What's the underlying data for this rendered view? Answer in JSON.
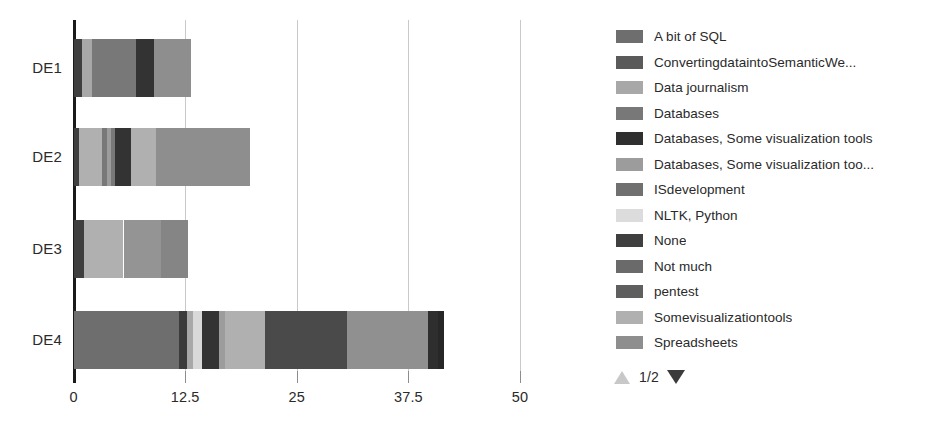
{
  "chart_data": {
    "type": "bar",
    "orientation": "horizontal",
    "stacked": true,
    "title": "",
    "xlabel": "",
    "ylabel": "",
    "xlim": [
      0,
      50
    ],
    "xticks": [
      0,
      12.5,
      25,
      37.5,
      50
    ],
    "xtick_labels": [
      "0",
      "12.5",
      "25",
      "37.5",
      "50"
    ],
    "categories": [
      "DE1",
      "DE2",
      "DE3",
      "DE4"
    ],
    "grid": true,
    "legend_position": "right",
    "series": [
      {
        "name": "A bit of SQL",
        "color": "#6e6e6e",
        "values": [
          0,
          0,
          0,
          11.8
        ]
      },
      {
        "name": "ConvertingdataintoSemanticWe...",
        "color": "#5a5a5a",
        "values": [
          0,
          0,
          0,
          0.8
        ]
      },
      {
        "name": "Data journalism",
        "color": "#a8a8a8",
        "values": [
          1.1,
          0,
          0,
          0.7
        ]
      },
      {
        "name": "Databases",
        "color": "#787878",
        "values": [
          4.9,
          0,
          0,
          0
        ]
      },
      {
        "name": "Databases, Some visualization tools",
        "color": "#333333",
        "values": [
          2.0,
          1.7,
          0,
          1.9
        ]
      },
      {
        "name": "Databases, Some visualization too...",
        "color": "#9c9c9c",
        "values": [
          0,
          1.6,
          0,
          0.7
        ]
      },
      {
        "name": "ISdevelopment",
        "color": "#707070",
        "values": [
          0,
          0,
          0,
          0
        ]
      },
      {
        "name": "NLTK, Python",
        "color": "#d9d9d9",
        "values": [
          0,
          0,
          0,
          1.0
        ]
      },
      {
        "name": "None",
        "color": "#3f3f3f",
        "values": [
          1.0,
          0,
          1.2,
          9.1
        ]
      },
      {
        "name": "Not much",
        "color": "#6a6a6a",
        "values": [
          0,
          0,
          0,
          0
        ]
      },
      {
        "name": "pentest",
        "color": "#5f5f5f",
        "values": [
          0,
          0,
          0,
          1.1
        ]
      },
      {
        "name": "Somevisualizationtools",
        "color": "#b0b0b0",
        "values": [
          0,
          5.9,
          4.4,
          4.5
        ]
      },
      {
        "name": "Spreadsheets",
        "color": "#8e8e8e",
        "values": [
          4.2,
          10.6,
          7.0,
          9.1
        ]
      }
    ],
    "bars": [
      {
        "category": "DE1",
        "total": 13.2,
        "segments": [
          {
            "label": "None",
            "value": 1.0,
            "color": "#3f3f3f"
          },
          {
            "label": "Data journalism",
            "value": 1.1,
            "color": "#a8a8a8"
          },
          {
            "label": "Databases",
            "value": 4.9,
            "color": "#787878"
          },
          {
            "label": "Databases, Some visualization tools",
            "value": 2.0,
            "color": "#333333"
          },
          {
            "label": "Spreadsheets",
            "value": 4.2,
            "color": "#8e8e8e"
          }
        ]
      },
      {
        "category": "DE2",
        "total": 19.8,
        "segments": [
          {
            "label": "None",
            "value": 0.6,
            "color": "#3f3f3f"
          },
          {
            "label": "Somevisualizationtools",
            "value": 2.6,
            "color": "#b0b0b0"
          },
          {
            "label": "Databases",
            "value": 0.5,
            "color": "#787878"
          },
          {
            "label": "Databases, Some visualization too...",
            "value": 0.5,
            "color": "#9c9c9c"
          },
          {
            "label": "Databases",
            "value": 0.5,
            "color": "#787878"
          },
          {
            "label": "Databases, Some visualization tools",
            "value": 1.7,
            "color": "#333333"
          },
          {
            "label": "Somevisualizationtools",
            "value": 2.8,
            "color": "#b0b0b0"
          },
          {
            "label": "Spreadsheets",
            "value": 10.6,
            "color": "#8e8e8e"
          }
        ]
      },
      {
        "category": "DE3",
        "total": 12.8,
        "segments": [
          {
            "label": "None",
            "value": 1.2,
            "color": "#3f3f3f"
          },
          {
            "label": "Somevisualizationtools",
            "value": 4.4,
            "color": "#b0b0b0"
          },
          {
            "label": "Spreadsheets",
            "value": 4.2,
            "color": "#949494"
          },
          {
            "label": "Databases",
            "value": 3.0,
            "color": "#858585"
          }
        ]
      },
      {
        "category": "DE4",
        "total": 41.5,
        "segments": [
          {
            "label": "A bit of SQL",
            "value": 11.8,
            "color": "#6e6e6e"
          },
          {
            "label": "None",
            "value": 0.9,
            "color": "#3b3b3b"
          },
          {
            "label": "Data journalism",
            "value": 0.7,
            "color": "#a8a8a8"
          },
          {
            "label": "NLTK, Python",
            "value": 1.0,
            "color": "#d9d9d9"
          },
          {
            "label": "Databases, Some visualization tools",
            "value": 1.9,
            "color": "#333333"
          },
          {
            "label": "Databases, Some visualization too...",
            "value": 0.7,
            "color": "#9c9c9c"
          },
          {
            "label": "Somevisualizationtools",
            "value": 4.5,
            "color": "#b0b0b0"
          },
          {
            "label": "None",
            "value": 9.1,
            "color": "#4a4a4a"
          },
          {
            "label": "Spreadsheets",
            "value": 9.1,
            "color": "#909090"
          },
          {
            "label": "pentest",
            "value": 1.1,
            "color": "#2e2e2e"
          },
          {
            "label": "ConvertingdataintoSemanticWe...",
            "value": 0.7,
            "color": "#272727"
          }
        ]
      }
    ]
  },
  "legend": {
    "items": [
      {
        "label": "A bit of SQL",
        "color": "#6e6e6e"
      },
      {
        "label": "ConvertingdataintoSemanticWe...",
        "color": "#5a5a5a"
      },
      {
        "label": "Data journalism",
        "color": "#a8a8a8"
      },
      {
        "label": "Databases",
        "color": "#787878"
      },
      {
        "label": "Databases, Some visualization tools",
        "color": "#2f2f2f"
      },
      {
        "label": "Databases, Some visualization too...",
        "color": "#9c9c9c"
      },
      {
        "label": "ISdevelopment",
        "color": "#707070"
      },
      {
        "label": "NLTK, Python",
        "color": "#dcdcdc"
      },
      {
        "label": "None",
        "color": "#3f3f3f"
      },
      {
        "label": "Not much",
        "color": "#6a6a6a"
      },
      {
        "label": "pentest",
        "color": "#5f5f5f"
      },
      {
        "label": "Somevisualizationtools",
        "color": "#b0b0b0"
      },
      {
        "label": "Spreadsheets",
        "color": "#8e8e8e"
      }
    ]
  },
  "pager": {
    "prev_icon": "triangle-up-icon",
    "next_icon": "triangle-down-icon",
    "label": "1/2"
  }
}
